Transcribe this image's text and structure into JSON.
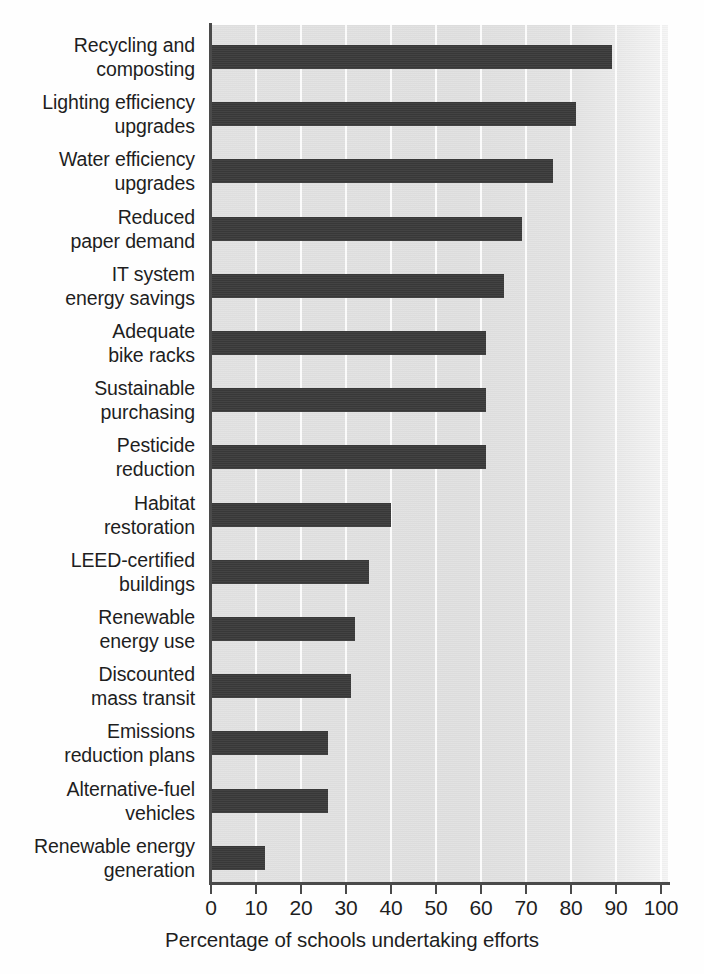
{
  "chart_data": {
    "type": "bar",
    "orientation": "horizontal",
    "title": "",
    "xlabel": "Percentage of schools undertaking efforts",
    "ylabel": "",
    "xlim": [
      0,
      100
    ],
    "xticks": [
      0,
      10,
      20,
      30,
      40,
      50,
      60,
      70,
      80,
      90,
      100
    ],
    "grid": true,
    "legend": false,
    "bar_color": "#3b3b3b",
    "plot_background": "#e3e3e3",
    "categories": [
      "Recycling and composting",
      "Lighting efficiency upgrades",
      "Water efficiency upgrades",
      "Reduced paper demand",
      "IT system energy savings",
      "Adequate bike racks",
      "Sustainable purchasing",
      "Pesticide reduction",
      "Habitat restoration",
      "LEED-certified buildings",
      "Renewable energy use",
      "Discounted mass transit",
      "Emissions reduction plans",
      "Alternative-fuel vehicles",
      "Renewable energy generation"
    ],
    "values": [
      89,
      81,
      76,
      69,
      65,
      61,
      61,
      61,
      40,
      35,
      32,
      31,
      26,
      26,
      12
    ]
  },
  "axis": {
    "x_title": "Percentage of schools undertaking efforts",
    "tick_labels": [
      "0",
      "10",
      "20",
      "30",
      "40",
      "50",
      "60",
      "70",
      "80",
      "90",
      "100"
    ]
  },
  "category_labels": [
    {
      "line1": "Recycling and",
      "line2": "composting"
    },
    {
      "line1": "Lighting efficiency",
      "line2": "upgrades"
    },
    {
      "line1": "Water efficiency",
      "line2": "upgrades"
    },
    {
      "line1": "Reduced",
      "line2": "paper demand"
    },
    {
      "line1": "IT system",
      "line2": "energy savings"
    },
    {
      "line1": "Adequate",
      "line2": "bike racks"
    },
    {
      "line1": "Sustainable",
      "line2": "purchasing"
    },
    {
      "line1": "Pesticide",
      "line2": "reduction"
    },
    {
      "line1": "Habitat",
      "line2": "restoration"
    },
    {
      "line1": "LEED-certified",
      "line2": "buildings"
    },
    {
      "line1": "Renewable",
      "line2": "energy use"
    },
    {
      "line1": "Discounted",
      "line2": "mass transit"
    },
    {
      "line1": "Emissions",
      "line2": "reduction plans"
    },
    {
      "line1": "Alternative-fuel",
      "line2": "vehicles"
    },
    {
      "line1": "Renewable energy",
      "line2": "generation"
    }
  ]
}
